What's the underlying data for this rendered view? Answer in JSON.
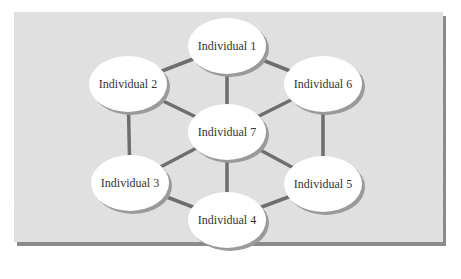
{
  "diagram": {
    "type": "network",
    "colors": {
      "background": "#ffffff",
      "panel": "#e2e2e2",
      "panel_shadow": "#8a8a8a",
      "edge": "#6e6e6e",
      "node_fill": "#ffffff",
      "node_shadow": "#9a9a9a",
      "text": "#333333"
    },
    "nodes": [
      {
        "id": "1",
        "label": "Individual 1",
        "cx": 227,
        "cy": 46
      },
      {
        "id": "2",
        "label": "Individual 2",
        "cx": 128,
        "cy": 84
      },
      {
        "id": "6",
        "label": "Individual 6",
        "cx": 323,
        "cy": 84
      },
      {
        "id": "7",
        "label": "Individual 7",
        "cx": 227,
        "cy": 132
      },
      {
        "id": "3",
        "label": "Individual 3",
        "cx": 130,
        "cy": 183
      },
      {
        "id": "5",
        "label": "Individual 5",
        "cx": 323,
        "cy": 184
      },
      {
        "id": "4",
        "label": "Individual 4",
        "cx": 227,
        "cy": 220
      }
    ],
    "edges": [
      [
        "1",
        "2"
      ],
      [
        "1",
        "6"
      ],
      [
        "1",
        "7"
      ],
      [
        "2",
        "7"
      ],
      [
        "2",
        "3"
      ],
      [
        "6",
        "7"
      ],
      [
        "6",
        "5"
      ],
      [
        "7",
        "3"
      ],
      [
        "7",
        "5"
      ],
      [
        "7",
        "4"
      ],
      [
        "3",
        "4"
      ],
      [
        "5",
        "4"
      ]
    ]
  }
}
